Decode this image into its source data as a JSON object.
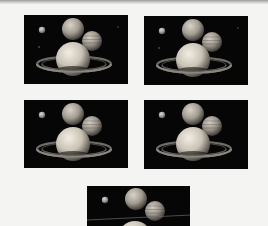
{
  "page": {
    "background": "#f4f4f3",
    "edge_color": "#9a9a9a"
  },
  "thumbnails": [
    {
      "id": 1,
      "x": 24,
      "y": 15,
      "w": 104,
      "h": 69,
      "ring_view": "tilted",
      "stars": true
    },
    {
      "id": 2,
      "x": 144,
      "y": 16,
      "w": 104,
      "h": 69,
      "ring_view": "tilted",
      "stars": true
    },
    {
      "id": 3,
      "x": 24,
      "y": 100,
      "w": 104,
      "h": 68,
      "ring_view": "tilted",
      "stars": false
    },
    {
      "id": 4,
      "x": 144,
      "y": 100,
      "w": 104,
      "h": 69,
      "ring_view": "tilted",
      "stars": false
    },
    {
      "id": 5,
      "x": 87,
      "y": 186,
      "w": 103,
      "h": 40,
      "ring_view": "edge-on",
      "stars": false
    }
  ],
  "scene": {
    "subject": "Saturn-with-planets",
    "space_color": "#060606",
    "planet_color": "#d9d3c8",
    "ring_color": "#8a857d"
  }
}
